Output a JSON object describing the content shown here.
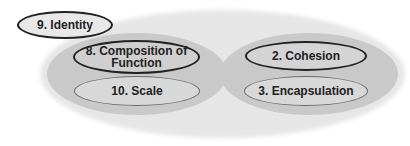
{
  "diagram": {
    "outer_region": {
      "fill": "#e6e6e6"
    },
    "groups": [
      {
        "name": "left-group",
        "fill": "#c9c9c9",
        "items": [
          {
            "label": "8. Composition of Function",
            "line1": "8. Composition of",
            "line2": "Function",
            "border": "dark"
          },
          {
            "label": "10. Scale",
            "border": "light"
          }
        ]
      },
      {
        "name": "right-group",
        "fill": "#c9c9c9",
        "items": [
          {
            "label": "2. Cohesion",
            "border": "dark"
          },
          {
            "label": "3. Encapsulation",
            "border": "light"
          }
        ]
      }
    ],
    "standalone": {
      "label": "9. Identity",
      "border": "dark"
    }
  }
}
